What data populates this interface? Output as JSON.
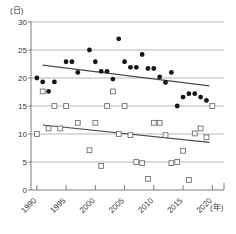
{
  "chart_data": {
    "type": "scatter",
    "title": "",
    "xlabel": "(年)",
    "ylabel": "(日)",
    "xlim": [
      1989,
      2022
    ],
    "ylim": [
      0,
      30
    ],
    "xticks": [
      1990,
      1995,
      2000,
      2005,
      2010,
      2015,
      2020
    ],
    "xtick_labels": [
      "1990",
      "1995",
      "2000",
      "2005",
      "2010",
      "2015",
      "2020"
    ],
    "yticks": [
      0,
      5,
      10,
      15,
      20,
      25,
      30
    ],
    "ytick_labels": [
      "0",
      "5",
      "10",
      "15",
      "20",
      "25",
      "30"
    ],
    "grid": true,
    "grid_axis": "y",
    "legend": "none",
    "series": [
      {
        "name": "filled-circle-series",
        "marker": "filled-circle",
        "color": "#161616",
        "points": [
          [
            1990,
            20.0
          ],
          [
            1991,
            19.3
          ],
          [
            1992,
            17.6
          ],
          [
            1993,
            19.3
          ],
          [
            1995,
            22.9
          ],
          [
            1996,
            22.9
          ],
          [
            1997,
            21.0
          ],
          [
            1999,
            25.0
          ],
          [
            2000,
            22.9
          ],
          [
            2001,
            21.2
          ],
          [
            2002,
            21.2
          ],
          [
            2003,
            19.8
          ],
          [
            2004,
            27.0
          ],
          [
            2005,
            22.9
          ],
          [
            2006,
            21.9
          ],
          [
            2007,
            21.9
          ],
          [
            2008,
            24.2
          ],
          [
            2009,
            21.7
          ],
          [
            2010,
            21.7
          ],
          [
            2011,
            20.2
          ],
          [
            2012,
            19.2
          ],
          [
            2013,
            21.0
          ],
          [
            2014,
            15.0
          ],
          [
            2015,
            16.6
          ],
          [
            2016,
            17.2
          ],
          [
            2017,
            17.2
          ],
          [
            2018,
            16.6
          ],
          [
            2019,
            16.0
          ]
        ]
      },
      {
        "name": "open-square-series",
        "marker": "open-square",
        "color": "#ffffff",
        "points": [
          [
            1990,
            10.0
          ],
          [
            1991,
            17.6
          ],
          [
            1992,
            11.0
          ],
          [
            1993,
            15.0
          ],
          [
            1994,
            11.0
          ],
          [
            1995,
            15.0
          ],
          [
            1997,
            12.0
          ],
          [
            1999,
            7.1
          ],
          [
            2000,
            12.0
          ],
          [
            2001,
            4.3
          ],
          [
            2002,
            15.0
          ],
          [
            2003,
            17.6
          ],
          [
            2004,
            10.0
          ],
          [
            2005,
            15.0
          ],
          [
            2006,
            9.8
          ],
          [
            2007,
            5.0
          ],
          [
            2008,
            4.8
          ],
          [
            2009,
            2.0
          ],
          [
            2010,
            12.0
          ],
          [
            2011,
            12.0
          ],
          [
            2012,
            9.8
          ],
          [
            2013,
            4.8
          ],
          [
            2014,
            5.0
          ],
          [
            2015,
            7.0
          ],
          [
            2016,
            1.8
          ],
          [
            2017,
            10.1
          ],
          [
            2018,
            11.0
          ],
          [
            2019,
            9.4
          ],
          [
            2020,
            15.0
          ]
        ]
      }
    ],
    "trendlines": [
      {
        "name": "upper-trendline",
        "x_start": 1991.0,
        "y_start": 22.3,
        "x_end": 2019.5,
        "y_end": 18.6
      },
      {
        "name": "lower-trendline",
        "x_start": 1991.0,
        "y_start": 11.6,
        "x_end": 2019.5,
        "y_end": 8.5
      }
    ]
  }
}
